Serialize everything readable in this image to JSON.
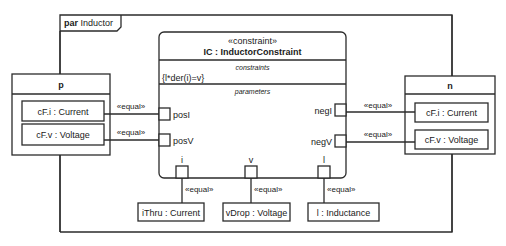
{
  "frame": {
    "kind": "par",
    "name": "Inductor"
  },
  "constraint_block": {
    "stereotype": "«constraint»",
    "title": "IC : InductorConstraint",
    "constraints_header": "constraints",
    "constraint_expr": "{l*der(i)=v}",
    "parameters_header": "parameters",
    "ports": {
      "posI": "posI",
      "posV": "posV",
      "negI": "negI",
      "negV": "negV",
      "i": "i",
      "v": "v",
      "l": "l"
    }
  },
  "blocks": {
    "p": {
      "title": "p",
      "parts": [
        "cF.i : Current",
        "cF.v : Voltage"
      ]
    },
    "n": {
      "title": "n",
      "parts": [
        "cF.i : Current",
        "cF.v : Voltage"
      ]
    },
    "bottom": [
      "iThru : Current",
      "vDrop : Voltage",
      "l : Inductance"
    ]
  },
  "connector_label": "«equal»"
}
